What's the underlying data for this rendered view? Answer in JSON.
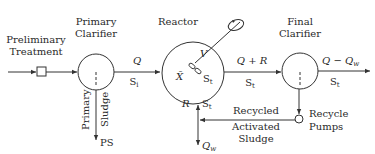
{
  "diagram": {
    "units": {
      "preliminary": {
        "label_line1": "Preliminary",
        "label_line2": "Treatment"
      },
      "primary_clarifier": {
        "label_line1": "Primary",
        "label_line2": "Clarifier"
      },
      "reactor": {
        "label": "Reactor",
        "volume": "V",
        "biomass": "X̄",
        "substrate": "S",
        "substrate_sub": "t"
      },
      "final_clarifier": {
        "label_line1": "Final",
        "label_line2": "Clarifier"
      },
      "recycle_pumps": {
        "label_line1": "Recycle",
        "label_line2": "Pumps"
      }
    },
    "streams": {
      "influent_to_reactor": {
        "flow": "Q",
        "conc": "S",
        "conc_sub": "i"
      },
      "reactor_to_final": {
        "flow": "Q + R",
        "conc": "S",
        "conc_sub": "t"
      },
      "effluent": {
        "flow": "Q − Q",
        "flow_sub": "w",
        "conc": "S",
        "conc_sub": "t"
      },
      "recycle": {
        "flow": "R",
        "conc": "S",
        "conc_sub": "t"
      },
      "waste": {
        "flow": "Q",
        "flow_sub": "w"
      },
      "primary_sludge": {
        "label_line1": "Primary",
        "label_line2": "Sludge",
        "abbr": "PS"
      },
      "ras": {
        "label_line1": "Recycled",
        "label_line2": "Activated",
        "label_line3": "Sludge"
      }
    }
  }
}
